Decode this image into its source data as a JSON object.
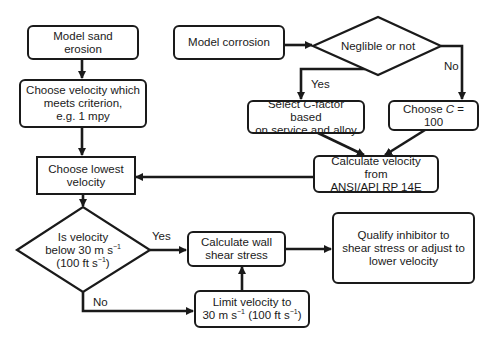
{
  "diagram": {
    "type": "flowchart",
    "nodes": {
      "model_sand_erosion": {
        "label": "Model sand erosion",
        "shape": "rounded-rect"
      },
      "model_corrosion": {
        "label": "Model corrosion",
        "shape": "rounded-rect"
      },
      "negligible_decision": {
        "label": "Neglible or not",
        "shape": "diamond"
      },
      "choose_velocity_criterion": {
        "line1": "Choose velocity which",
        "line2": "meets criterion,",
        "line3": "e.g. 1 mpy",
        "shape": "rounded-rect"
      },
      "select_c_factor": {
        "pre": "Select ",
        "italic": "C",
        "post": "-factor based",
        "line2": "on service and alloy",
        "shape": "rounded-rect"
      },
      "choose_c_100": {
        "pre": "Choose ",
        "italic": "C",
        "post": " = 100",
        "shape": "rounded-rect"
      },
      "calculate_velocity_api": {
        "line1": "Calculate velocity from",
        "line2": "ANSI/API RP 14E",
        "shape": "rounded-rect"
      },
      "choose_lowest_velocity": {
        "line1": "Choose lowest",
        "line2": "velocity",
        "shape": "rect"
      },
      "velocity_limit_decision": {
        "line1": "Is velocity",
        "line2a": "below 30 m s",
        "sup": "−1",
        "line3a": "(100 ft s",
        "line3b": ")",
        "shape": "diamond"
      },
      "calculate_wall_shear": {
        "line1": "Calculate wall",
        "line2": "shear stress",
        "shape": "rounded-rect"
      },
      "qualify_inhibitor": {
        "line1": "Qualify inhibitor to",
        "line2": "shear stress or adjust to",
        "line3": "lower velocity",
        "shape": "rounded-rect"
      },
      "limit_velocity": {
        "line1": "Limit velocity to",
        "line2a": "30 m s",
        "line2b": " (100 ft s",
        "line2c": ")",
        "sup": "−1",
        "shape": "rounded-rect"
      }
    },
    "edge_labels": {
      "negligible_yes": "Yes",
      "negligible_no": "No",
      "velocity_yes": "Yes",
      "velocity_no": "No"
    },
    "edges": [
      {
        "from": "model_sand_erosion",
        "to": "choose_velocity_criterion"
      },
      {
        "from": "choose_velocity_criterion",
        "to": "choose_lowest_velocity"
      },
      {
        "from": "model_corrosion",
        "to": "negligible_decision"
      },
      {
        "from": "negligible_decision",
        "to": "select_c_factor",
        "label": "Yes"
      },
      {
        "from": "negligible_decision",
        "to": "choose_c_100",
        "label": "No"
      },
      {
        "from": "select_c_factor",
        "to": "calculate_velocity_api"
      },
      {
        "from": "choose_c_100",
        "to": "calculate_velocity_api"
      },
      {
        "from": "calculate_velocity_api",
        "to": "choose_lowest_velocity"
      },
      {
        "from": "choose_lowest_velocity",
        "to": "velocity_limit_decision"
      },
      {
        "from": "velocity_limit_decision",
        "to": "calculate_wall_shear",
        "label": "Yes"
      },
      {
        "from": "velocity_limit_decision",
        "to": "limit_velocity",
        "label": "No"
      },
      {
        "from": "limit_velocity",
        "to": "calculate_wall_shear"
      },
      {
        "from": "calculate_wall_shear",
        "to": "qualify_inhibitor"
      }
    ],
    "colors": {
      "line": "#1a1a1a",
      "background": "#ffffff"
    }
  }
}
